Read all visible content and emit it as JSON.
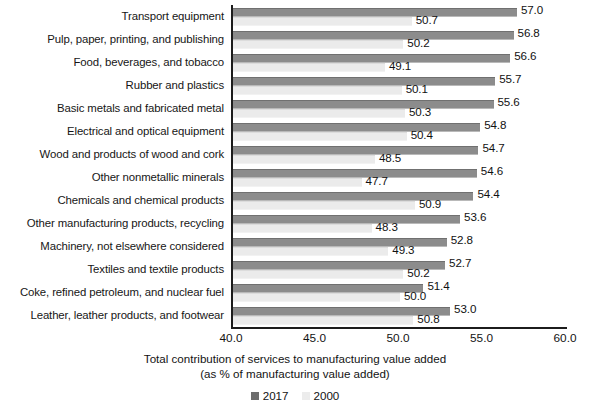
{
  "chart_data": {
    "type": "bar",
    "orientation": "horizontal",
    "title": "",
    "xlabel_line1": "Total contribution of services to manufacturing value added",
    "xlabel_line2": "(as % of manufacturing value added)",
    "ylabel": "",
    "xlim": [
      40.0,
      60.0
    ],
    "xticks": [
      "40.0",
      "45.0",
      "50.0",
      "55.0",
      "60.0"
    ],
    "xtick_values": [
      40.0,
      45.0,
      50.0,
      55.0,
      60.0
    ],
    "grid": false,
    "legend_position": "bottom",
    "categories": [
      "Transport equipment",
      "Pulp, paper, printing, and publishing",
      "Food, beverages, and tobacco",
      "Rubber and plastics",
      "Basic metals and fabricated metal",
      "Electrical and optical equipment",
      "Wood and products of wood and cork",
      "Other nonmetallic minerals",
      "Chemicals and chemical products",
      "Other manufacturing products, recycling",
      "Machinery, not elsewhere considered",
      "Textiles and textile products",
      "Coke, refined petroleum, and nuclear fuel",
      "Leather, leather products, and footwear"
    ],
    "series": [
      {
        "name": "2017",
        "color": "#8c8c8c",
        "values": [
          57.0,
          56.8,
          56.6,
          55.7,
          55.6,
          54.8,
          54.7,
          54.6,
          54.4,
          53.6,
          52.8,
          52.7,
          51.4,
          53.0
        ],
        "labels": [
          "57.0",
          "56.8",
          "56.6",
          "55.7",
          "55.6",
          "54.8",
          "54.7",
          "54.6",
          "54.4",
          "53.6",
          "52.8",
          "52.7",
          "51.4",
          "53.0"
        ]
      },
      {
        "name": "2000",
        "color": "#ebebeb",
        "values": [
          50.7,
          50.2,
          49.1,
          50.1,
          50.3,
          50.4,
          48.5,
          47.7,
          50.9,
          48.3,
          49.3,
          50.2,
          50.0,
          50.8
        ],
        "labels": [
          "50.7",
          "50.2",
          "49.1",
          "50.1",
          "50.3",
          "50.4",
          "48.5",
          "47.7",
          "50.9",
          "48.3",
          "49.3",
          "50.2",
          "50.0",
          "50.8"
        ]
      }
    ]
  },
  "legend": {
    "items": [
      {
        "label": "2017",
        "swatch": "swatch-2017"
      },
      {
        "label": "2000",
        "swatch": "swatch-2000"
      }
    ]
  }
}
